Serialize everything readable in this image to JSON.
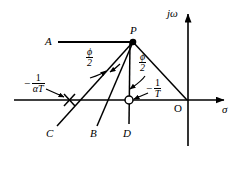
{
  "figure": {
    "background": "#ffffff",
    "stroke": "#000000",
    "axes": {
      "real_axis_label": "σ",
      "imag_axis_label": "jω",
      "origin_label": "O"
    },
    "points": {
      "P": "P",
      "A": "A",
      "B": "B",
      "C": "C",
      "D": "D"
    },
    "angles": {
      "left_phi_num": "ϕ",
      "left_phi_den": "2",
      "right_phi_num": "ϕ",
      "right_phi_den": "2"
    },
    "markers": {
      "pole_label_minus": "−",
      "pole_label_num": "1",
      "pole_label_den": "αT",
      "zero_label_minus": "−",
      "zero_label_num": "1",
      "zero_label_den": "T"
    }
  }
}
